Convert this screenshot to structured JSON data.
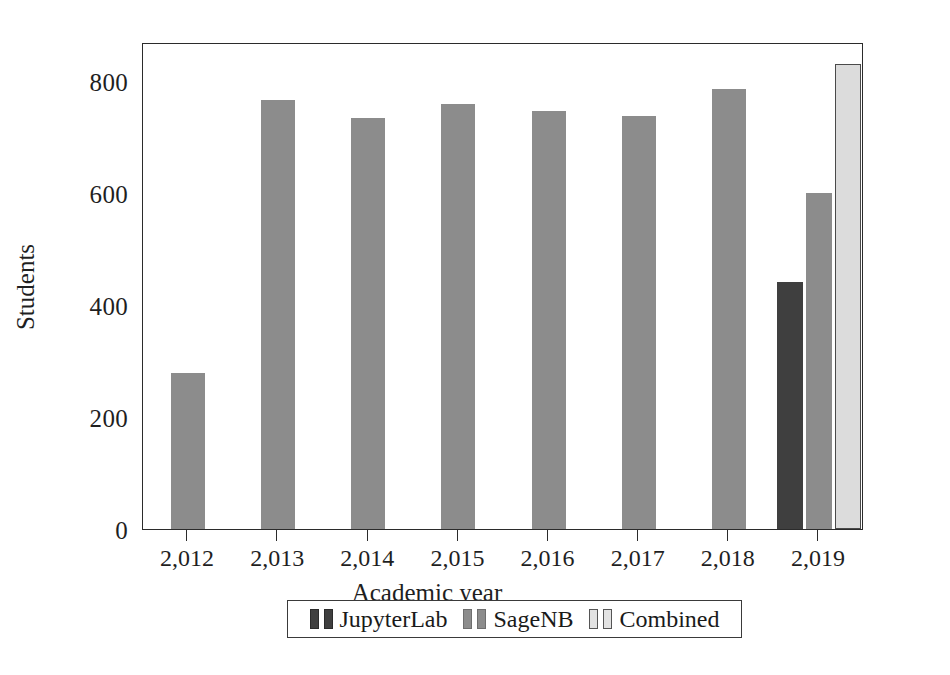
{
  "chart_data": {
    "type": "bar",
    "title": "",
    "xlabel": "Academic year",
    "ylabel": "Students",
    "categories": [
      "2,012",
      "2,013",
      "2,014",
      "2,015",
      "2,016",
      "2,017",
      "2,018",
      "2,019"
    ],
    "x_tick_labels": [
      "2,012",
      "2,013",
      "2,014",
      "2,015",
      "2,016",
      "2,017",
      "2,018",
      "2,019"
    ],
    "y_tick_labels": [
      "0",
      "200",
      "400",
      "600",
      "800"
    ],
    "y_tick_values": [
      0,
      200,
      400,
      600,
      800
    ],
    "ylim": [
      0,
      870
    ],
    "grid": false,
    "legend_position": "below-axis",
    "series": [
      {
        "name": "JupyterLab",
        "color": "#3f3f3f",
        "values": [
          null,
          null,
          null,
          null,
          null,
          null,
          null,
          441
        ]
      },
      {
        "name": "SageNB",
        "color": "#8c8c8c",
        "values": [
          278,
          766,
          734,
          760,
          747,
          737,
          786,
          600
        ]
      },
      {
        "name": "Combined",
        "color": "#dcdcdc",
        "values": [
          null,
          null,
          null,
          null,
          null,
          null,
          null,
          830
        ]
      }
    ]
  },
  "axes": {
    "y_label": "Students",
    "x_label": "Academic year",
    "y_ticks": [
      {
        "label": "800",
        "value": 800
      },
      {
        "label": "600",
        "value": 600
      },
      {
        "label": "400",
        "value": 400
      },
      {
        "label": "200",
        "value": 200
      },
      {
        "label": "0",
        "value": 0
      }
    ],
    "x_ticks": [
      {
        "label": "2,012"
      },
      {
        "label": "2,013"
      },
      {
        "label": "2,014"
      },
      {
        "label": "2,015"
      },
      {
        "label": "2,016"
      },
      {
        "label": "2,017"
      },
      {
        "label": "2,018"
      },
      {
        "label": "2,019"
      }
    ]
  },
  "legend": {
    "entries": [
      {
        "label": "JupyterLab",
        "color": "#3f3f3f",
        "border": "#2b2b2b"
      },
      {
        "label": "SageNB",
        "color": "#8c8c8c",
        "border": "#6e6e6e"
      },
      {
        "label": "Combined",
        "color": "#e2e2e2",
        "border": "#555555"
      }
    ]
  },
  "colors": {
    "axis": "#2b2b2b",
    "background": "#ffffff",
    "text": "#1a1a1a",
    "jupyterlab": "#3f3f3f",
    "sagenb": "#8c8c8c",
    "combined": "#dcdcdc"
  }
}
